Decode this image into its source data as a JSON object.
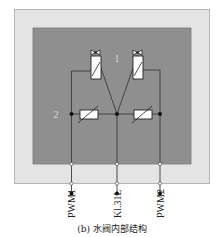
{
  "diagram": {
    "caption": "(b) 水阀内部结构",
    "callouts": {
      "valves": "1",
      "resistors": "2"
    },
    "terminals": [
      {
        "label": "PWM1"
      },
      {
        "label": "Kl.31L"
      },
      {
        "label": "PWM2"
      }
    ],
    "colors": {
      "outer_housing": "#e4e4e4",
      "inner_housing": "#8f8f8f",
      "wire": "#3a3a3a",
      "component_fill": "#ffffff",
      "terminal_dot": "#111111"
    }
  }
}
